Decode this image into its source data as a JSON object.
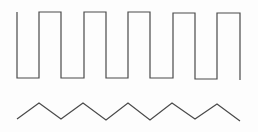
{
  "diagram": {
    "stroke_color": "#4a4a4a",
    "background": "#fdfdfd",
    "square_wave": {
      "points": [
        [
          17,
          12
        ],
        [
          17,
          78
        ],
        [
          39,
          78
        ],
        [
          39,
          12
        ],
        [
          61,
          12
        ],
        [
          61,
          78
        ],
        [
          84,
          78
        ],
        [
          84,
          12
        ],
        [
          106,
          12
        ],
        [
          106,
          78
        ],
        [
          128,
          78
        ],
        [
          128,
          12
        ],
        [
          150,
          12
        ],
        [
          150,
          78
        ],
        [
          173,
          78
        ],
        [
          173,
          13
        ],
        [
          195,
          13
        ],
        [
          195,
          79
        ],
        [
          217,
          79
        ],
        [
          217,
          13
        ],
        [
          240,
          13
        ],
        [
          240,
          80
        ]
      ]
    },
    "triangle_wave": {
      "points": [
        [
          17,
          119
        ],
        [
          39,
          103
        ],
        [
          61,
          119
        ],
        [
          83,
          103
        ],
        [
          106,
          120
        ],
        [
          128,
          103
        ],
        [
          150,
          120
        ],
        [
          172,
          103
        ],
        [
          195,
          119
        ],
        [
          217,
          104
        ],
        [
          240,
          121
        ]
      ]
    }
  }
}
